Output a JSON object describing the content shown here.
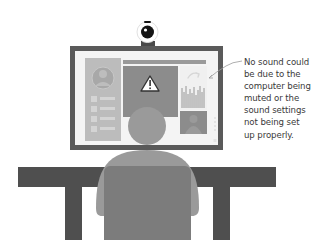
{
  "illustration": {
    "subject": "person seated at a desk in front of a monitor with a webcam, showing a video call with a warning sign",
    "icons": {
      "webcam": "webcam-icon",
      "warning": "warning-triangle-icon",
      "arrow": "curved-arrow-icon",
      "avatar": "user-avatar-icon"
    },
    "colors": {
      "monitor_frame": "#5a5a5a",
      "screen_bg": "#f4f4f4",
      "panel": "#b8b8b8",
      "main_panel": "#8c8c8c",
      "person": "#9a9a9a",
      "chair": "#7c7c7c",
      "desk": "#4f4f4f",
      "text": "#3a3a3a"
    }
  },
  "annotation": {
    "lines": [
      "No sound could",
      "be due to the",
      "computer being",
      "muted or the",
      "sound settings",
      "not being set",
      "up properly."
    ]
  }
}
